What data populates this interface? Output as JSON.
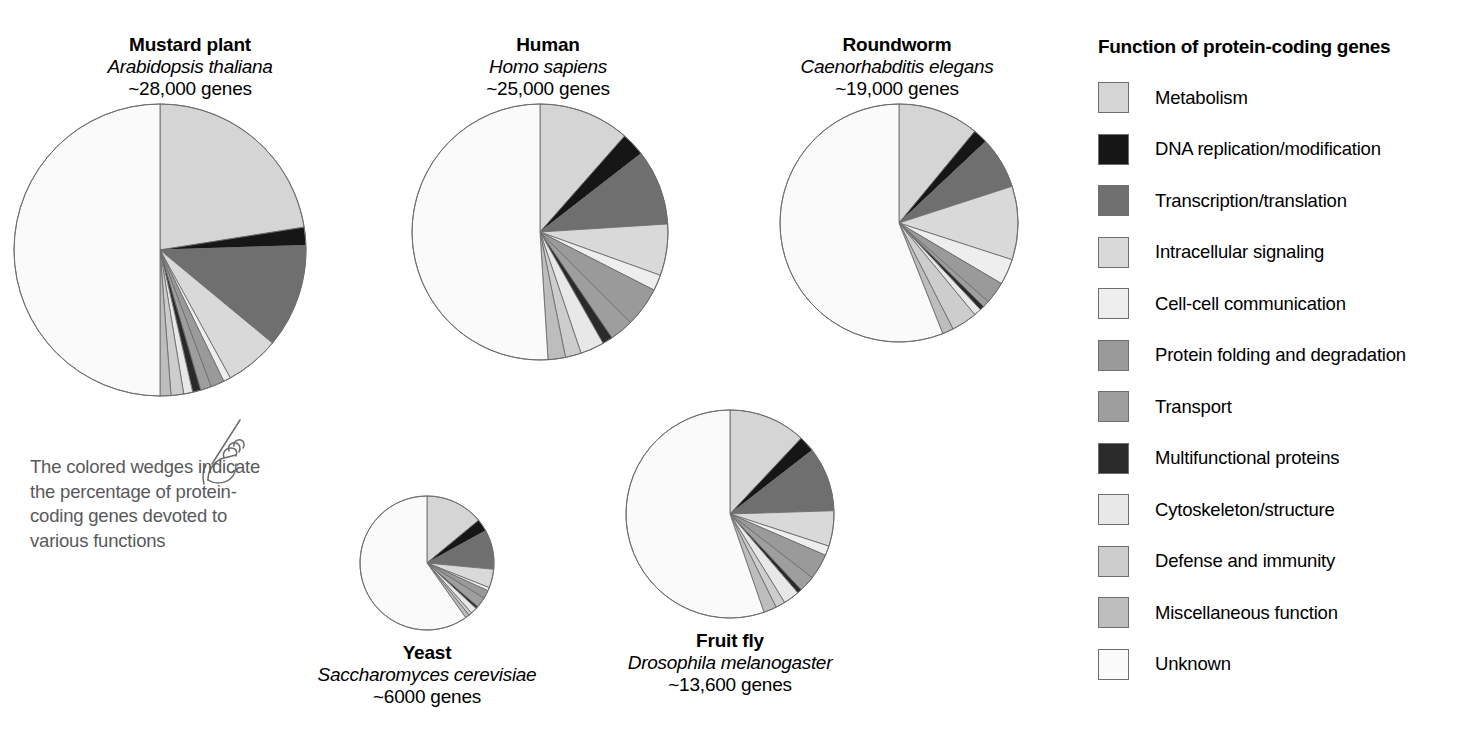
{
  "legend": {
    "title": "Function of protein-coding genes",
    "items": [
      {
        "label": "Metabolism",
        "color": "#d5d5d5"
      },
      {
        "label": "DNA replication/modification",
        "color": "#161616"
      },
      {
        "label": "Transcription/translation",
        "color": "#6f6f6f"
      },
      {
        "label": "Intracellular signaling",
        "color": "#d9d9d9"
      },
      {
        "label": "Cell-cell communication",
        "color": "#eeeeee"
      },
      {
        "label": "Protein folding and degradation",
        "color": "#9a9a9a"
      },
      {
        "label": "Transport",
        "color": "#9e9e9e"
      },
      {
        "label": "Multifunctional proteins",
        "color": "#2a2a2a"
      },
      {
        "label": "Cytoskeleton/structure",
        "color": "#e8e8e8"
      },
      {
        "label": "Defense and immunity",
        "color": "#cdcdcd"
      },
      {
        "label": "Miscellaneous function",
        "color": "#bdbdbd"
      },
      {
        "label": "Unknown",
        "color": "#fafafa"
      }
    ]
  },
  "annotation": {
    "text": "The colored wedges indicate the percentage of protein-coding genes devoted to various functions"
  },
  "organisms": [
    {
      "id": "mustard-plant",
      "common_name": "Mustard plant",
      "latin_name": "Arabidopsis thaliana",
      "gene_count": "~28,000 genes",
      "caption_position": "above"
    },
    {
      "id": "human",
      "common_name": "Human",
      "latin_name": "Homo sapiens",
      "gene_count": "~25,000 genes",
      "caption_position": "above"
    },
    {
      "id": "roundworm",
      "common_name": "Roundworm",
      "latin_name": "Caenorhabditis elegans",
      "gene_count": "~19,000 genes",
      "caption_position": "above"
    },
    {
      "id": "yeast",
      "common_name": "Yeast",
      "latin_name": "Saccharomyces cerevisiae",
      "gene_count": "~6000 genes",
      "caption_position": "below"
    },
    {
      "id": "fruit-fly",
      "common_name": "Fruit fly",
      "latin_name": "Drosophila melanogaster",
      "gene_count": "~13,600 genes",
      "caption_position": "below"
    }
  ],
  "chart_data": {
    "type": "pie",
    "title": "Function of protein-coding genes",
    "note": "Five pie charts, one per organism. Wedges start at 12 o'clock and run clockwise; the final Unknown wedge closes the circle. Values are percentages of protein-coding genes estimated from wedge angles.",
    "categories": [
      "Metabolism",
      "DNA replication/modification",
      "Transcription/translation",
      "Intracellular signaling",
      "Cell-cell communication",
      "Protein folding and degradation",
      "Transport",
      "Multifunctional proteins",
      "Cytoskeleton/structure",
      "Defense and immunity",
      "Miscellaneous function",
      "Unknown"
    ],
    "colors": [
      "#d5d5d5",
      "#161616",
      "#6f6f6f",
      "#d9d9d9",
      "#eeeeee",
      "#9a9a9a",
      "#9e9e9e",
      "#2a2a2a",
      "#e8e8e8",
      "#cdcdcd",
      "#bdbdbd",
      "#fafafa"
    ],
    "series": [
      {
        "name": "Mustard plant",
        "gene_count": "~28,000 genes",
        "radius_px": 146,
        "values": [
          22.5,
          2.0,
          11.5,
          6.0,
          0.8,
          1.5,
          1.2,
          0.9,
          1.0,
          1.4,
          1.2,
          50.0
        ]
      },
      {
        "name": "Human",
        "gene_count": "~25,000 genes",
        "radius_px": 128,
        "values": [
          11.5,
          3.0,
          9.5,
          6.5,
          2.0,
          5.0,
          3.0,
          1.3,
          3.0,
          2.0,
          2.2,
          51.0
        ]
      },
      {
        "name": "Roundworm",
        "gene_count": "~19,000 genes",
        "radius_px": 119,
        "values": [
          11.0,
          2.0,
          7.0,
          10.0,
          3.5,
          3.0,
          0.9,
          0.6,
          1.0,
          3.5,
          1.5,
          56.0
        ]
      },
      {
        "name": "Yeast",
        "gene_count": "~6000 genes",
        "radius_px": 67,
        "values": [
          14.0,
          3.0,
          9.5,
          4.5,
          0.8,
          2.0,
          2.5,
          0.6,
          1.5,
          0.8,
          1.0,
          59.8
        ]
      },
      {
        "name": "Fruit fly",
        "gene_count": "~13,600 genes",
        "radius_px": 104,
        "values": [
          12.0,
          2.5,
          10.0,
          5.5,
          1.5,
          4.0,
          2.5,
          0.7,
          2.5,
          1.5,
          2.0,
          55.3
        ]
      }
    ]
  }
}
